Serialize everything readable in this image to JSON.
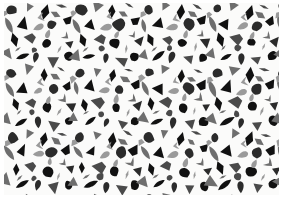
{
  "meta": {
    "title": "Abstract Terrazzo Confetti Pattern",
    "description": "Seamless repeating pattern of scattered irregular geometric shapes",
    "width": 282,
    "height": 203
  },
  "canvas": {
    "background_color": "#ffffff",
    "pattern_background_color": "#fbfbfa",
    "margin_left": 4,
    "margin_top": 3,
    "pattern_width": 275,
    "pattern_height": 192
  },
  "palette": {
    "black": "#111111",
    "charcoal": "#2b2b2b",
    "dark_gray": "#4a4a4a",
    "mid_gray": "#6e6e6e",
    "light_gray": "#9a9a9a",
    "background": "#fbfbfa"
  },
  "pattern": {
    "style_name": "terrazzo-confetti",
    "tile_width": 68,
    "tile_height": 64,
    "tile_columns": 5,
    "tile_rows": 4,
    "shape_kinds": [
      "triangle",
      "wedge",
      "diamond",
      "leaf",
      "blob",
      "sliver",
      "teardrop",
      "chevron"
    ],
    "shape_count_per_tile": 26,
    "noise_opacity": 0.05
  },
  "tile_shapes": [
    {
      "kind": "blob",
      "x": 8,
      "y": 6,
      "s": 11,
      "r": 18,
      "c": "charcoal"
    },
    {
      "kind": "triangle",
      "x": 25,
      "y": 4,
      "s": 10,
      "r": 200,
      "c": "mid_gray"
    },
    {
      "kind": "diamond",
      "x": 41,
      "y": 9,
      "s": 12,
      "r": 8,
      "c": "black"
    },
    {
      "kind": "sliver",
      "x": 57,
      "y": 3,
      "s": 9,
      "r": 115,
      "c": "dark_gray"
    },
    {
      "kind": "wedge",
      "x": 63,
      "y": 18,
      "s": 11,
      "r": 40,
      "c": "black"
    },
    {
      "kind": "leaf",
      "x": 5,
      "y": 22,
      "s": 13,
      "r": 155,
      "c": "mid_gray"
    },
    {
      "kind": "triangle",
      "x": 19,
      "y": 20,
      "s": 12,
      "r": 25,
      "c": "black"
    },
    {
      "kind": "teardrop",
      "x": 34,
      "y": 24,
      "s": 10,
      "r": 250,
      "c": "light_gray"
    },
    {
      "kind": "blob",
      "x": 48,
      "y": 22,
      "s": 12,
      "r": 95,
      "c": "charcoal"
    },
    {
      "kind": "chevron",
      "x": 60,
      "y": 32,
      "s": 9,
      "r": 320,
      "c": "mid_gray"
    },
    {
      "kind": "diamond",
      "x": 11,
      "y": 38,
      "s": 11,
      "r": 170,
      "c": "black"
    },
    {
      "kind": "wedge",
      "x": 27,
      "y": 36,
      "s": 13,
      "r": 280,
      "c": "dark_gray"
    },
    {
      "kind": "blob",
      "x": 43,
      "y": 40,
      "s": 11,
      "r": 60,
      "c": "black"
    },
    {
      "kind": "sliver",
      "x": 55,
      "y": 45,
      "s": 8,
      "r": 20,
      "c": "light_gray"
    },
    {
      "kind": "triangle",
      "x": 3,
      "y": 52,
      "s": 12,
      "r": 135,
      "c": "mid_gray"
    },
    {
      "kind": "leaf",
      "x": 18,
      "y": 54,
      "s": 12,
      "r": 65,
      "c": "black"
    },
    {
      "kind": "teardrop",
      "x": 33,
      "y": 55,
      "s": 10,
      "r": 190,
      "c": "charcoal"
    },
    {
      "kind": "triangle",
      "x": 49,
      "y": 57,
      "s": 11,
      "r": 300,
      "c": "dark_gray"
    },
    {
      "kind": "blob",
      "x": 64,
      "y": 54,
      "s": 10,
      "r": 130,
      "c": "black"
    },
    {
      "kind": "chevron",
      "x": 37,
      "y": 14,
      "s": 8,
      "r": 75,
      "c": "light_gray"
    },
    {
      "kind": "sliver",
      "x": 15,
      "y": 46,
      "s": 7,
      "r": 235,
      "c": "mid_gray"
    },
    {
      "kind": "diamond",
      "x": 52,
      "y": 11,
      "s": 9,
      "r": 300,
      "c": "mid_gray"
    },
    {
      "kind": "wedge",
      "x": 2,
      "y": 12,
      "s": 8,
      "r": 210,
      "c": "light_gray"
    },
    {
      "kind": "teardrop",
      "x": 45,
      "y": 32,
      "s": 8,
      "r": 15,
      "c": "light_gray"
    },
    {
      "kind": "blob",
      "x": 29,
      "y": 46,
      "s": 7,
      "r": 100,
      "c": "dark_gray"
    },
    {
      "kind": "triangle",
      "x": 67,
      "y": 40,
      "s": 9,
      "r": 175,
      "c": "charcoal"
    }
  ]
}
